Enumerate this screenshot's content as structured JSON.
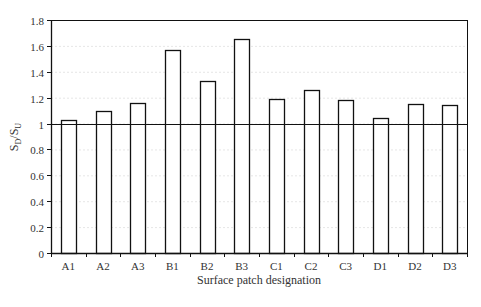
{
  "chart_data": {
    "type": "bar",
    "title": "",
    "xlabel": "Surface patch designation",
    "ylabel": "S_D/S_U",
    "ylabel_main": "S",
    "ylabel_sub1": "D",
    "ylabel_sep": "/S",
    "ylabel_sub2": "U",
    "categories": [
      "A1",
      "A2",
      "A3",
      "B1",
      "B2",
      "B3",
      "C1",
      "C2",
      "C3",
      "D1",
      "D2",
      "D3"
    ],
    "values": [
      1.03,
      1.1,
      1.16,
      1.57,
      1.33,
      1.65,
      1.19,
      1.26,
      1.18,
      1.04,
      1.15,
      1.14
    ],
    "ylim": [
      0,
      1.8
    ],
    "yticks": [
      0,
      0.2,
      0.4,
      0.6,
      0.8,
      1,
      1.2,
      1.4,
      1.6,
      1.8
    ],
    "ytick_labels": [
      "0",
      "0.2",
      "0.4",
      "0.6",
      "0.8",
      "1",
      "1.2",
      "1.4",
      "1.6",
      "1.8"
    ],
    "reference_line": 1.0,
    "grid": true,
    "legend": null
  },
  "colors": {
    "bar_fill": "#ffffff",
    "bar_stroke": "#111111",
    "axis": "#111111",
    "grid": "#e6e6e6",
    "reference_line": "#111111"
  }
}
